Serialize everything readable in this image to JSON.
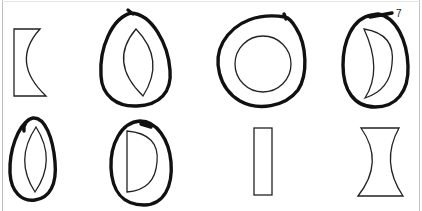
{
  "figure": {
    "annotation_label": "7",
    "shapes": [
      {
        "id": 1,
        "name": "plano-concave-lens",
        "circled": false
      },
      {
        "id": 2,
        "name": "biconvex-lens",
        "circled": true
      },
      {
        "id": 3,
        "name": "circle-lens",
        "circled": true
      },
      {
        "id": 4,
        "name": "concave-convex-meniscus-lens",
        "circled": true
      },
      {
        "id": 5,
        "name": "biconvex-lens-narrow",
        "circled": true
      },
      {
        "id": 6,
        "name": "plano-convex-lens",
        "circled": true
      },
      {
        "id": 7,
        "name": "rectangular-slab",
        "circled": false
      },
      {
        "id": 8,
        "name": "biconcave-lens",
        "circled": false
      }
    ]
  }
}
